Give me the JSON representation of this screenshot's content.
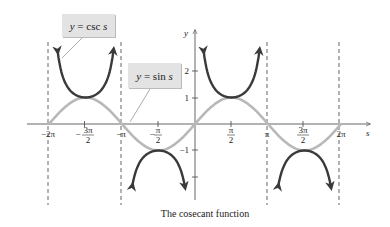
{
  "chart_data": {
    "type": "line",
    "title": "The cosecant function",
    "xlabel": "s",
    "ylabel": "y",
    "x_ticks": [
      "-2π",
      "-3π/2",
      "-π",
      "-π/2",
      "π/2",
      "π",
      "3π/2",
      "2π"
    ],
    "y_ticks": [
      "2",
      "1",
      "-1"
    ],
    "xlim": [
      "-2π",
      "2π"
    ],
    "ylim": [
      -2.5,
      3
    ],
    "asymptotes": [
      "-2π",
      "-π",
      "π",
      "2π"
    ],
    "series": [
      {
        "name": "y = sin s",
        "color": "#b5b5b5",
        "function": "sin",
        "domain": [
          "-2π",
          "2π"
        ]
      },
      {
        "name": "y = csc s",
        "color": "#3a3a3a",
        "function": "csc",
        "domain": [
          "-2π",
          "π"
        ]
      }
    ],
    "legend_labels": [
      "y = csc s",
      "y = sin s"
    ],
    "grid": false
  },
  "labels": {
    "csc": {
      "y": "y",
      "eq": " = csc ",
      "s": "s"
    },
    "sin": {
      "y": "y",
      "eq": " = sin ",
      "s": "s"
    }
  },
  "axis": {
    "x": "s",
    "y": "y"
  },
  "ticks": {
    "x": [
      {
        "num": "−2π"
      },
      {
        "num": "3π",
        "den": "2",
        "neg": "−"
      },
      {
        "num": "−π"
      },
      {
        "num": "π",
        "den": "2",
        "neg": "−"
      },
      {
        "num": "π",
        "den": "2"
      },
      {
        "num": "π"
      },
      {
        "num": "3π",
        "den": "2"
      },
      {
        "num": "2π"
      }
    ],
    "y": [
      "2",
      "1",
      "−1"
    ]
  },
  "caption": "The cosecant function"
}
